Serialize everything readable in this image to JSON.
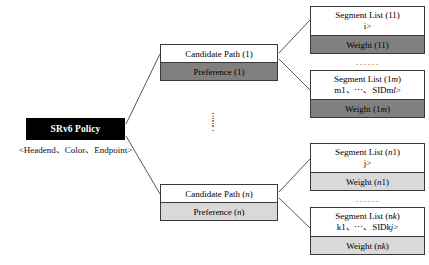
{
  "diagram": {
    "colors": {
      "root_fill": "#000000",
      "root_text": "#ffffff",
      "dark_fill": "#808080",
      "light_fill": "#d9d9d9",
      "box_border": "#3a3a3a",
      "background": "#ffffff"
    }
  },
  "root": {
    "label": "SRv6 Policy",
    "subtitle": "<Headend、Color、Endpoint>"
  },
  "candidate_paths": [
    {
      "title": "Candidate Path (1)",
      "preference": "Preference (1)",
      "preference_fill": "dark"
    },
    {
      "title": "Candidate Path (n)",
      "preference": "Preference (n)",
      "preference_fill": "light"
    }
  ],
  "segment_lists": [
    {
      "title": "Segment List (11)",
      "sids": "<SID11、⋯、SID1i>",
      "weight": "Weight (11)",
      "weight_fill": "dark"
    },
    {
      "title": "Segment List (1m)",
      "sids": "<SIDm1、⋯、SIDml>",
      "weight": "Weight (1m)",
      "weight_fill": "dark"
    },
    {
      "title": "Segment List (n1)",
      "sids": "<SID11、⋯、SID1j>",
      "weight": "Weight (n1)",
      "weight_fill": "light"
    },
    {
      "title": "Segment List (nk)",
      "sids": "<SIDk1、⋯、SIDkj>",
      "weight": "Weight (nk)",
      "weight_fill": "light"
    }
  ],
  "ellipses": {
    "horizontal_top": "······",
    "horizontal_bottom": "······",
    "vertical": "⋮"
  }
}
